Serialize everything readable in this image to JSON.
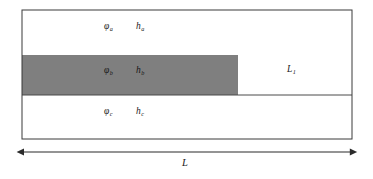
{
  "figure": {
    "type": "layered-cross-section-schematic",
    "background_color": "#ffffff",
    "line_color": "#3b3b3b",
    "band_fill_color": "#7f7f7f",
    "text_color": "#1a1a1a"
  },
  "outer_box": {
    "name": "domain-boundary",
    "x": 22,
    "y": 10,
    "width": 330,
    "height": 129
  },
  "layers": [
    {
      "id": "a",
      "name": "upper-layer",
      "potential_symbol": "φ",
      "potential_subscript": "a",
      "thickness_symbol": "h",
      "thickness_subscript": "a",
      "fill": "#ffffff",
      "label_x": 104,
      "label_y": 27,
      "thickness_label_x": 136,
      "thickness_label_y": 27
    },
    {
      "id": "b",
      "name": "middle-layer-shaded",
      "potential_symbol": "φ",
      "potential_subscript": "b",
      "thickness_symbol": "h",
      "thickness_subscript": "b",
      "fill": "#7f7f7f",
      "label_x": 104,
      "label_y": 70,
      "thickness_label_x": 136,
      "thickness_label_y": 70
    },
    {
      "id": "c",
      "name": "lower-layer",
      "potential_symbol": "φ",
      "potential_subscript": "c",
      "thickness_symbol": "h",
      "thickness_subscript": "c",
      "fill": "#ffffff",
      "label_x": 104,
      "label_y": 110,
      "thickness_label_x": 136,
      "thickness_label_y": 110
    }
  ],
  "shaded_band": {
    "name": "shaded-region",
    "x": 22,
    "y": 55,
    "width": 216,
    "height": 40,
    "fill": "#7f7f7f"
  },
  "interface_line": {
    "name": "lower-interface-line",
    "x1": 22,
    "y1": 95,
    "x2": 352,
    "y2": 95
  },
  "right_region": {
    "name": "right-region",
    "label_symbol": "L",
    "label_subscript": "1",
    "label_x": 287,
    "label_y": 69
  },
  "dimension": {
    "name": "overall-length-dimension",
    "label": "L",
    "label_x": 182,
    "label_y": 158,
    "arrow_y": 152,
    "arrow_x1": 22,
    "arrow_x2": 352
  }
}
